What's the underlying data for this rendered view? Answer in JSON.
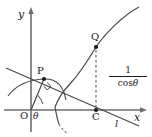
{
  "figure": {
    "kind": "geometry-diagram",
    "background_color": "#ffffff",
    "stroke_color": "#3a3a3a",
    "label_color": "#1a1a1a",
    "axes": {
      "y_axis_label": "y",
      "x_axis_label": "x",
      "origin_label": "O"
    },
    "points": [
      {
        "name": "point-p",
        "label": "P",
        "x": 44,
        "y": 79
      },
      {
        "name": "point-q",
        "label": "Q",
        "x": 96,
        "y": 47
      },
      {
        "name": "point-c",
        "label": "C",
        "x": 96,
        "y": 110
      }
    ],
    "angle": {
      "label": "θ",
      "vertex_label": "O"
    },
    "line": {
      "label": "l"
    },
    "length_label": {
      "numerator": "1",
      "denominator_prefix": "cos",
      "denominator_symbol": "θ",
      "full_text": "1/cosθ"
    },
    "marks": {
      "right_angle_at": "P",
      "dashed_segment": "Q to C"
    }
  }
}
